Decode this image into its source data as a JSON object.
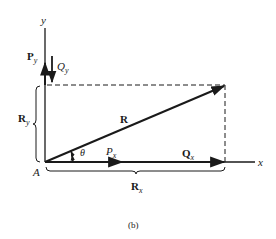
{
  "diagram": {
    "caption": "(b)",
    "axes": {
      "x_label": "x",
      "y_label": "y",
      "origin_label": "A"
    },
    "vectors": {
      "R": {
        "label": "R"
      },
      "Py": {
        "label": "P",
        "sub": "y"
      },
      "Qy": {
        "label": "Q",
        "sub": "y"
      },
      "Px": {
        "label": "P",
        "sub": "x"
      },
      "Qx": {
        "label": "Q",
        "sub": "x"
      }
    },
    "components": {
      "Ry": {
        "label": "R",
        "sub": "y"
      },
      "Rx": {
        "label": "R",
        "sub": "x"
      }
    },
    "angle": {
      "label": "θ"
    },
    "colors": {
      "ink": "#1a1a1a",
      "background": "#ffffff"
    }
  }
}
